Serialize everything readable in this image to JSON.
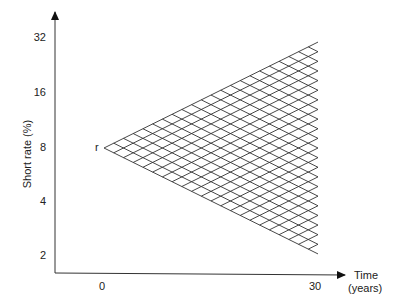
{
  "diagram": {
    "type": "interest-rate-tree",
    "y_axis": {
      "label": "Short rate (%)",
      "ticks": [
        {
          "label": "32",
          "y": 38
        },
        {
          "label": "16",
          "y": 93
        },
        {
          "label": "8",
          "y": 148
        },
        {
          "label": "4",
          "y": 202
        },
        {
          "label": "2",
          "y": 256
        }
      ]
    },
    "x_axis": {
      "label_line1": "Time",
      "label_line2": "(years)",
      "ticks": [
        {
          "label": "0",
          "x": 102
        },
        {
          "label": "30",
          "x": 316
        }
      ]
    },
    "root_label": "r",
    "lattice": {
      "steps": 22,
      "x0": 104,
      "y0": 148,
      "x1": 318,
      "color": "#333333"
    }
  }
}
